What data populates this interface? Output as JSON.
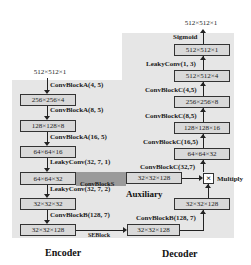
{
  "encoder": {
    "title": "Encoder",
    "input": "512×512×1",
    "boxes": [
      "256×256×4",
      "128×128×8",
      "64×64×16",
      "64×64×32",
      "32×32×32",
      "32×32×128"
    ],
    "ops": [
      "ConvBlockA(4, 5)",
      "ConvBlockA(8, 5)",
      "ConvBlockA(16, 5)",
      "LeakyConv(32, 7, 1)",
      "LeakyConv(32, 7, 2)",
      "ConvBlockB(128, 7)"
    ],
    "skip_label": "SEBlock"
  },
  "auxiliary": {
    "title": "Auxiliary",
    "band_label": "ConvBlockS",
    "box": "32×32×128",
    "lower_op": "ConvBlockB(128, 7)"
  },
  "decoder": {
    "title": "Decoder",
    "output": "512×512×1",
    "boxes": [
      "512×512×1",
      "512×512×4",
      "256×256×8",
      "128×128×16",
      "64×64×32",
      "32×32×128",
      "32×32×128"
    ],
    "ops": [
      "Sigmoid",
      "LeakyConv(1, 3)",
      "ConvBlockC(4,5)",
      "ConvBlockC(8,5)",
      "ConvBlockC(16,5)",
      "ConvBlockC(32,7)"
    ],
    "multiply_label": "Multiply",
    "multiply_symbol": "×"
  }
}
